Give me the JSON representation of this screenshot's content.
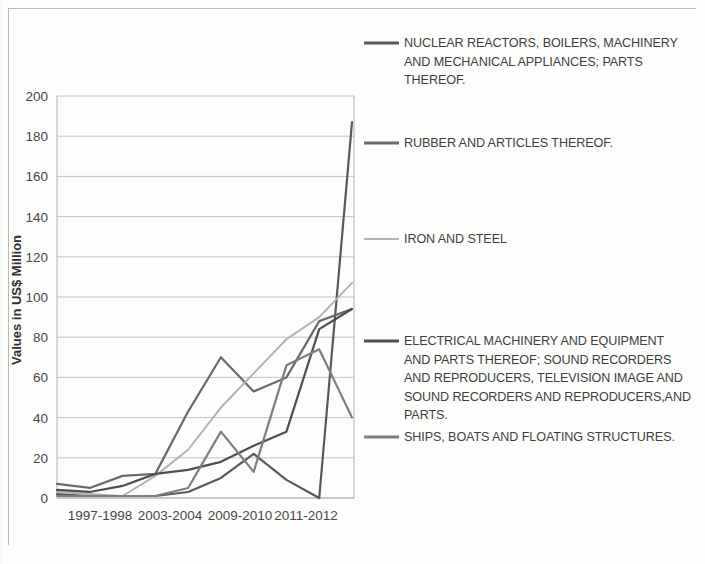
{
  "chart_data": {
    "type": "line",
    "title": "",
    "xlabel": "",
    "ylabel": "Values in US$ Million",
    "ylim": [
      0,
      200
    ],
    "ytick_step": 20,
    "yticks": [
      0,
      20,
      40,
      60,
      80,
      100,
      120,
      140,
      160,
      180,
      200
    ],
    "grid": true,
    "legend_position": "right",
    "categories": [
      "1997-1998",
      "1999-2000",
      "2001-2002",
      "2003-2004",
      "2005-2006",
      "2007-2008",
      "2009-2010",
      "2010-2011",
      "2011-2012",
      "2012-2013"
    ],
    "visible_xtick_labels": [
      "1997-1998",
      "2003-2004",
      "2009-2010",
      "2011-2012"
    ],
    "series": [
      {
        "name": "NUCLEAR REACTORS, BOILERS, MACHINERY AND MECHANICAL APPLIANCES; PARTS THEREOF.",
        "color": "#595959",
        "values": [
          2,
          1,
          1,
          1,
          3,
          10,
          22,
          9,
          0,
          187
        ]
      },
      {
        "name": "RUBBER AND ARTICLES THEREOF.",
        "color": "#6b6b6b",
        "values": [
          7,
          5,
          11,
          12,
          43,
          70,
          53,
          60,
          88,
          94
        ]
      },
      {
        "name": "IRON AND STEEL",
        "color": "#b2b2b2",
        "values": [
          3,
          2,
          1,
          11,
          24,
          45,
          62,
          79,
          90,
          107
        ]
      },
      {
        "name": "ELECTRICAL MACHINERY AND EQUIPMENT AND PARTS THEREOF; SOUND RECORDERS AND REPRODUCERS, TELEVISION IMAGE AND SOUND RECORDERS AND REPRODUCERS,AND PARTS.",
        "color": "#4f4f4f",
        "values": [
          4,
          3,
          6,
          12,
          14,
          18,
          26,
          33,
          84,
          94
        ]
      },
      {
        "name": "SHIPS, BOATS AND FLOATING STRUCTURES.",
        "color": "#7d7d7d",
        "values": [
          1,
          1,
          1,
          1,
          5,
          33,
          13,
          66,
          74,
          40
        ]
      }
    ]
  },
  "legend": {
    "items": [
      {
        "label": "NUCLEAR REACTORS, BOILERS, MACHINERY AND MECHANICAL APPLIANCES; PARTS THEREOF.",
        "color": "#595959"
      },
      {
        "label": "RUBBER AND ARTICLES THEREOF.",
        "color": "#6b6b6b"
      },
      {
        "label": "IRON AND STEEL",
        "color": "#b2b2b2"
      },
      {
        "label": "ELECTRICAL MACHINERY AND EQUIPMENT AND PARTS THEREOF; SOUND RECORDERS AND REPRODUCERS, TELEVISION IMAGE AND SOUND RECORDERS AND REPRODUCERS,AND PARTS.",
        "color": "#4f4f4f"
      },
      {
        "label": "SHIPS, BOATS AND FLOATING STRUCTURES.",
        "color": "#7d7d7d"
      }
    ]
  }
}
